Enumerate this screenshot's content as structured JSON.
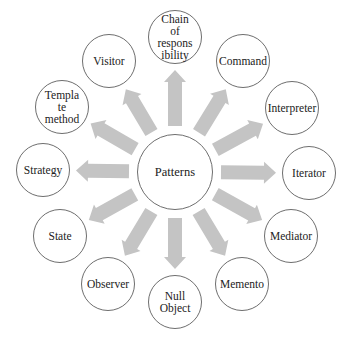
{
  "diagram": {
    "center": {
      "label": "Patterns",
      "x": 175,
      "y": 172,
      "r": 38
    },
    "arrow_color": "#c4c4c4",
    "stroke_color": "#6e6e6e",
    "nodes": [
      {
        "label": "Chain\nof\nrespons\nibility",
        "x": 175,
        "y": 37
      },
      {
        "label": "Command",
        "x": 243,
        "y": 61
      },
      {
        "label": "Interpreter",
        "x": 292,
        "y": 108
      },
      {
        "label": "Iterator",
        "x": 309,
        "y": 173
      },
      {
        "label": "Mediator",
        "x": 291,
        "y": 236
      },
      {
        "label": "Memento",
        "x": 242,
        "y": 284
      },
      {
        "label": "Null\nObject",
        "x": 175,
        "y": 302
      },
      {
        "label": "Observer",
        "x": 108,
        "y": 284
      },
      {
        "label": "State",
        "x": 60,
        "y": 236
      },
      {
        "label": "Strategy",
        "x": 43,
        "y": 170
      },
      {
        "label": "Templa\nte\nmethod",
        "x": 62,
        "y": 107
      },
      {
        "label": "Visitor",
        "x": 109,
        "y": 61
      }
    ],
    "node_radius": 27
  }
}
